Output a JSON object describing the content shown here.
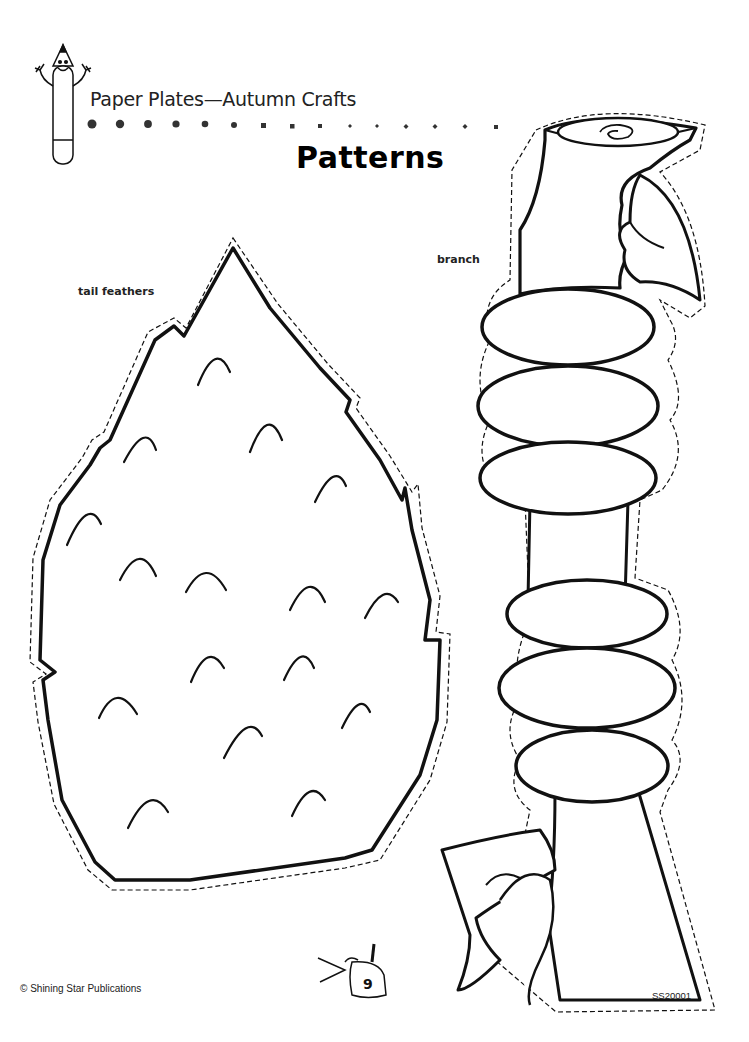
{
  "header": {
    "subtitle": "Paper Plates—Autumn Crafts",
    "title": "Patterns",
    "mascot_icon": "pencil-mascot-icon",
    "decoration": "dot-row-divider"
  },
  "patterns": [
    {
      "label": "tail feathers",
      "shape": "tail-feathers-pattern",
      "feather_marks": 22
    },
    {
      "label": "branch",
      "shape": "branch-pattern"
    }
  ],
  "footer": {
    "copyright": "© Shining Star Publications",
    "page_number": "9",
    "page_icon": "scissors-glue-icon",
    "code": "SS20001"
  },
  "colors": {
    "ink": "#111111",
    "paper": "#ffffff"
  }
}
